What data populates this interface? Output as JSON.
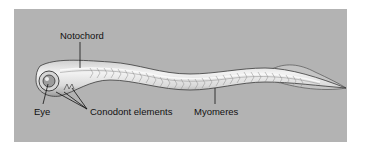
{
  "figure": {
    "labels": {
      "notochord": "Notochord",
      "eye": "Eye",
      "conodont_elements": "Conodont elements",
      "myomeres": "Myomeres"
    }
  },
  "colors": {
    "background": "#b3b3b3",
    "body_fill": "#d9d9d9",
    "body_highlight": "#efefef",
    "outline": "#3a3a3a",
    "text": "#111111"
  }
}
